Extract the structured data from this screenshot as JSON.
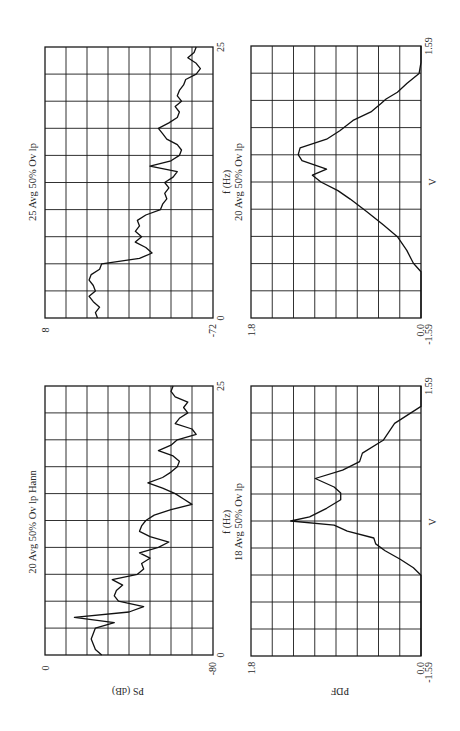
{
  "figure": {
    "orientation": "rotated 90 degrees counterclockwise",
    "panels": [
      {
        "id": "ps_25avg",
        "title": "25 Avg 50% Ov lp",
        "xlabel": "f (Hz)",
        "ylabel": "",
        "x_ticks": [
          "0",
          "25"
        ],
        "y_ticks": [
          "8",
          "-72"
        ]
      },
      {
        "id": "ps_20avg_hann",
        "title": "20 Avg 50% Ov lp Hann",
        "xlabel": "f (Hz)",
        "ylabel": "PS (dB)",
        "x_ticks": [
          "0",
          "25"
        ],
        "y_ticks": [
          "0",
          "-80"
        ]
      },
      {
        "id": "pdf_20avg",
        "title": "20 Avg 50% Ov lp",
        "xlabel": "V",
        "ylabel": "",
        "x_ticks": [
          "-1.59",
          "1.59"
        ],
        "y_ticks": [
          "1.8",
          "0.0"
        ]
      },
      {
        "id": "pdf_18avg",
        "title": "18 Avg 50% Ov lp",
        "xlabel": "V",
        "ylabel": "PDF",
        "x_ticks": [
          "-1.59",
          "1.59"
        ],
        "y_ticks": [
          "1.8",
          "0.0"
        ]
      }
    ]
  },
  "chart_data": [
    {
      "type": "line",
      "title": "25 Avg 50% Ov lp",
      "xlabel": "f (Hz)",
      "ylabel": "PS (dB)",
      "xlim": [
        0,
        25
      ],
      "ylim": [
        -72,
        8
      ],
      "grid": true,
      "x": [
        0,
        0.5,
        1,
        1.5,
        2,
        2.5,
        3,
        3.5,
        4,
        4.5,
        5,
        5.5,
        6,
        6.5,
        7,
        7.5,
        8,
        8.5,
        9,
        9.5,
        10,
        10.5,
        11,
        11.5,
        12,
        12.5,
        13,
        13.5,
        14,
        14.5,
        15,
        15.5,
        16,
        16.5,
        17,
        17.5,
        18,
        18.5,
        19,
        19.5,
        20,
        20.5,
        21,
        21.5,
        22,
        22.5,
        23,
        23.5,
        24,
        24.5,
        25
      ],
      "values": [
        -17,
        -16,
        -18,
        -15,
        -13,
        -16,
        -15,
        -13,
        -14,
        -18,
        -19,
        -37,
        -43,
        -40,
        -35,
        -38,
        -35,
        -37,
        -36,
        -40,
        -47,
        -48,
        -50,
        -49,
        -51,
        -49,
        -53,
        -55,
        -42,
        -52,
        -56,
        -57,
        -55,
        -50,
        -48,
        -46,
        -51,
        -55,
        -56,
        -54,
        -57,
        -55,
        -56,
        -58,
        -59,
        -64,
        -66,
        -64,
        -60,
        -63,
        -64
      ]
    },
    {
      "type": "line",
      "title": "20 Avg 50% Ov lp Hann",
      "xlabel": "f (Hz)",
      "ylabel": "PS (dB)",
      "xlim": [
        0,
        25
      ],
      "ylim": [
        -80,
        0
      ],
      "grid": true,
      "x": [
        0,
        0.5,
        1,
        1.5,
        2,
        2.5,
        3,
        3.5,
        4,
        4.5,
        5,
        5.5,
        6,
        6.5,
        7,
        7.5,
        8,
        8.5,
        9,
        9.5,
        10,
        10.5,
        11,
        11.5,
        12,
        12.5,
        13,
        13.5,
        14,
        14.5,
        15,
        15.5,
        16,
        16.5,
        17,
        17.5,
        18,
        18.5,
        19,
        19.5,
        20,
        20.5,
        21,
        21.5,
        22,
        22.5,
        23,
        23.5,
        24,
        24.5,
        25
      ],
      "values": [
        -27,
        -24,
        -23,
        -22,
        -23,
        -24,
        -33,
        -14,
        -40,
        -47,
        -35,
        -33,
        -34,
        -37,
        -32,
        -44,
        -47,
        -46,
        -50,
        -45,
        -54,
        -59,
        -50,
        -45,
        -46,
        -48,
        -52,
        -60,
        -70,
        -66,
        -62,
        -56,
        -49,
        -56,
        -60,
        -63,
        -64,
        -61,
        -54,
        -60,
        -63,
        -72,
        -70,
        -62,
        -64,
        -68,
        -66,
        -68,
        -62,
        -60,
        -61
      ]
    },
    {
      "type": "line",
      "title": "20 Avg 50% Ov lp",
      "xlabel": "V",
      "ylabel": "PDF",
      "xlim": [
        -1.59,
        1.59
      ],
      "ylim": [
        0.0,
        1.8
      ],
      "grid": true,
      "x": [
        -1.59,
        -1.27,
        -1.05,
        -0.95,
        -0.8,
        -0.64,
        -0.5,
        -0.35,
        -0.2,
        -0.1,
        0.0,
        0.08,
        0.15,
        0.25,
        0.32,
        0.4,
        0.5,
        0.6,
        0.72,
        0.82,
        0.92,
        0.97,
        1.05,
        1.15,
        1.27,
        1.4,
        1.59
      ],
      "values": [
        0.0,
        0.0,
        0.0,
        0.08,
        0.15,
        0.25,
        0.4,
        0.57,
        0.75,
        0.88,
        1.06,
        1.15,
        1.0,
        1.26,
        1.3,
        1.28,
        1.0,
        0.86,
        0.72,
        0.53,
        0.42,
        0.37,
        0.25,
        0.15,
        0.02,
        0.0,
        0.0
      ]
    },
    {
      "type": "line",
      "title": "18 Avg 50% Ov lp",
      "xlabel": "V",
      "ylabel": "PDF",
      "xlim": [
        -1.59,
        1.59
      ],
      "ylim": [
        0.0,
        1.8
      ],
      "grid": true,
      "x": [
        -1.59,
        -0.64,
        -0.55,
        -0.45,
        -0.35,
        -0.27,
        -0.2,
        -0.12,
        -0.05,
        0.0,
        0.05,
        0.15,
        0.25,
        0.33,
        0.4,
        0.5,
        0.6,
        0.7,
        0.8,
        0.95,
        1.15,
        1.35,
        1.59
      ],
      "values": [
        0.0,
        0.0,
        0.08,
        0.22,
        0.38,
        0.48,
        0.5,
        0.78,
        0.92,
        1.38,
        1.18,
        1.0,
        0.85,
        0.85,
        0.92,
        1.12,
        0.83,
        0.65,
        0.62,
        0.4,
        0.28,
        0.0,
        0.0
      ]
    }
  ]
}
